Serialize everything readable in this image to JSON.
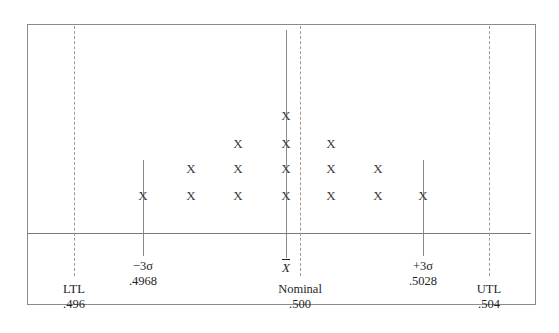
{
  "chart_data": {
    "type": "bar",
    "title": "",
    "subtitle": "",
    "xlabel": "",
    "ylabel": "",
    "marker": "X",
    "categories": [
      ".4968",
      "",
      "",
      ".500",
      "",
      "",
      ".5028"
    ],
    "values": [
      1,
      2,
      3,
      4,
      3,
      2,
      1
    ],
    "columns": [
      {
        "x_px": 143,
        "count": 1
      },
      {
        "x_px": 191,
        "count": 2
      },
      {
        "x_px": 238,
        "count": 3
      },
      {
        "x_px": 286,
        "count": 4
      },
      {
        "x_px": 331,
        "count": 3
      },
      {
        "x_px": 378,
        "count": 2
      },
      {
        "x_px": 423,
        "count": 1
      }
    ],
    "row_y_px": [
      195,
      168,
      143,
      115
    ],
    "total_points": 16,
    "grid": false,
    "legend": false,
    "reference_lines": [
      {
        "name": "LTL",
        "value": ".496",
        "x_px": 74,
        "style": "dashed",
        "top_px": 26,
        "bottom_px": 276
      },
      {
        "name": "-3 sigma",
        "value": ".4968",
        "x_px": 143,
        "style": "solid",
        "top_px": 160,
        "bottom_px": 256
      },
      {
        "name": "X-bar",
        "value": "",
        "x_px": 286,
        "style": "solid",
        "top_px": 30,
        "bottom_px": 258
      },
      {
        "name": "Nominal",
        "value": ".500",
        "x_px": 300,
        "style": "dashed",
        "top_px": 26,
        "bottom_px": 276
      },
      {
        "name": "+3 sigma",
        "value": ".5028",
        "x_px": 423,
        "style": "solid",
        "top_px": 160,
        "bottom_px": 256
      },
      {
        "name": "UTL",
        "value": ".504",
        "x_px": 489,
        "style": "dashed",
        "top_px": 26,
        "bottom_px": 276
      }
    ]
  },
  "chart": {
    "labels": {
      "ltl": {
        "top": "LTL",
        "bottom": ".496"
      },
      "lower_sigma": {
        "top": "−3σ",
        "bottom": ".4968"
      },
      "xbar": {
        "symbol": "X"
      },
      "nominal": {
        "top": "Nominal",
        "bottom": ".500"
      },
      "upper_sigma": {
        "top": "+3σ",
        "bottom": ".5028"
      },
      "utl": {
        "top": "UTL",
        "bottom": ".504"
      }
    }
  },
  "colors": {
    "frame": "#8b8b8b",
    "axis": "#7a7a7a",
    "solid_line": "#8a8a8a",
    "dashed_line": "#9a9a9a",
    "marker": "#3a3a3a",
    "text": "#1f1f1f",
    "background": "#ffffff"
  }
}
